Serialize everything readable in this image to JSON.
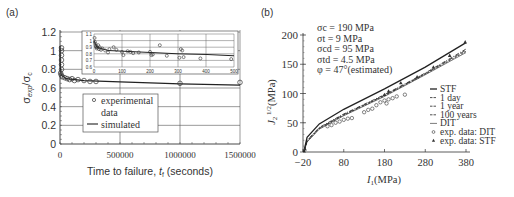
{
  "chart_data": [
    {
      "panel": "(a)",
      "type": "scatter",
      "title": "",
      "xlabel": "Time to failure, t_f (seconds)",
      "ylabel": "σ_exp/σ_c",
      "xlim": [
        0,
        1500000
      ],
      "ylim": [
        0,
        1.2
      ],
      "xticks": [
        "0",
        "500000",
        "1000000",
        "1500000"
      ],
      "yticks": [
        "0",
        "0.2",
        "0.4",
        "0.6",
        "0.8",
        "1",
        "1.2"
      ],
      "grid": true,
      "legend": {
        "position": "lower-center",
        "entries": [
          "experimental data",
          "simulated"
        ]
      },
      "series": [
        {
          "name": "experimental data",
          "marker": "circle-open",
          "points": [
            [
              0,
              1.03
            ],
            [
              0,
              1.0
            ],
            [
              0,
              0.95
            ],
            [
              0,
              0.9
            ],
            [
              0,
              0.85
            ],
            [
              0,
              0.8
            ],
            [
              5000,
              0.76
            ],
            [
              10000,
              0.74
            ],
            [
              20000,
              0.72
            ],
            [
              40000,
              0.71
            ],
            [
              60000,
              0.7
            ],
            [
              80000,
              0.69
            ],
            [
              100000,
              0.7
            ],
            [
              120000,
              0.68
            ],
            [
              150000,
              0.69
            ],
            [
              200000,
              0.68
            ],
            [
              250000,
              0.67
            ],
            [
              300000,
              0.67
            ],
            [
              1000000,
              0.65
            ],
            [
              1500000,
              0.66
            ]
          ]
        },
        {
          "name": "simulated",
          "style": "line",
          "points": [
            [
              0,
              1.05
            ],
            [
              2000,
              0.85
            ],
            [
              10000,
              0.74
            ],
            [
              50000,
              0.7
            ],
            [
              200000,
              0.68
            ],
            [
              500000,
              0.665
            ],
            [
              1000000,
              0.645
            ],
            [
              1500000,
              0.63
            ]
          ]
        }
      ],
      "inset": {
        "xlim": [
          0,
          500
        ],
        "ylim": [
          0.6,
          1.1
        ],
        "xticks": [
          "0",
          "100",
          "200",
          "300",
          "400",
          "500"
        ],
        "yticks": [
          "0.6",
          "0.7",
          "0.8",
          "0.9",
          "1",
          "1.1"
        ],
        "experimental": [
          [
            2,
            1.04
          ],
          [
            3,
            0.98
          ],
          [
            5,
            0.95
          ],
          [
            6,
            0.92
          ],
          [
            8,
            0.9
          ],
          [
            10,
            0.88
          ],
          [
            12,
            0.9
          ],
          [
            15,
            0.93
          ],
          [
            18,
            0.87
          ],
          [
            20,
            0.9
          ],
          [
            25,
            0.86
          ],
          [
            30,
            0.88
          ],
          [
            40,
            0.85
          ],
          [
            50,
            0.82
          ],
          [
            55,
            0.87
          ],
          [
            70,
            0.9
          ],
          [
            80,
            0.86
          ],
          [
            100,
            0.83
          ],
          [
            105,
            0.78
          ],
          [
            120,
            0.84
          ],
          [
            130,
            0.83
          ],
          [
            140,
            0.81
          ],
          [
            160,
            0.82
          ],
          [
            200,
            0.83
          ],
          [
            205,
            0.78
          ],
          [
            210,
            0.79
          ],
          [
            235,
            0.93
          ],
          [
            260,
            0.77
          ],
          [
            305,
            0.74
          ],
          [
            310,
            0.87
          ],
          [
            315,
            0.85
          ],
          [
            320,
            0.75
          ],
          [
            380,
            0.73
          ],
          [
            490,
            0.72
          ]
        ],
        "simulated": [
          [
            0,
            1.0
          ],
          [
            10,
            0.9
          ],
          [
            50,
            0.85
          ],
          [
            100,
            0.84
          ],
          [
            200,
            0.82
          ],
          [
            300,
            0.8
          ],
          [
            400,
            0.79
          ],
          [
            500,
            0.77
          ]
        ]
      }
    },
    {
      "panel": "(b)",
      "type": "line",
      "title": "",
      "xlabel": "I_1(MPa)",
      "ylabel": "J_2^{1/2}(MPa)",
      "xlim": [
        -20,
        380
      ],
      "ylim": [
        0,
        200
      ],
      "xticks": [
        "-20",
        "80",
        "180",
        "280",
        "380"
      ],
      "yticks": [
        "0",
        "50",
        "100",
        "150",
        "200"
      ],
      "grid": false,
      "annotations": [
        "σc = 190 MPa",
        "σt = 9 MPa",
        "σcd = 95 MPa",
        "σtd = 4.5 MPa",
        "φ = 47°(estimated)"
      ],
      "legend": {
        "position": "lower-right",
        "entries": [
          "STF",
          "1 day",
          "1 year",
          "100 years",
          "DIT",
          "exp. data: DIT",
          "exp. data: STF"
        ]
      },
      "series": [
        {
          "name": "STF",
          "style": "solid",
          "points": [
            [
              -18,
              0
            ],
            [
              -10,
              25
            ],
            [
              20,
              48
            ],
            [
              80,
              73
            ],
            [
              180,
              108
            ],
            [
              280,
              145
            ],
            [
              380,
              187
            ]
          ]
        },
        {
          "name": "1 day",
          "style": "dash-dot",
          "points": [
            [
              -18,
              0
            ],
            [
              -10,
              20
            ],
            [
              20,
              42
            ],
            [
              80,
              65
            ],
            [
              180,
              98
            ],
            [
              280,
              135
            ],
            [
              380,
              176
            ]
          ]
        },
        {
          "name": "1 year",
          "style": "long-dash",
          "points": [
            [
              -18,
              0
            ],
            [
              -10,
              19
            ],
            [
              20,
              41
            ],
            [
              80,
              64
            ],
            [
              180,
              97
            ],
            [
              280,
              134
            ],
            [
              380,
              174
            ]
          ]
        },
        {
          "name": "100 years",
          "style": "dashed",
          "points": [
            [
              -18,
              0
            ],
            [
              -10,
              18
            ],
            [
              20,
              40
            ],
            [
              80,
              63
            ],
            [
              180,
              96
            ],
            [
              280,
              133
            ],
            [
              380,
              172
            ]
          ]
        },
        {
          "name": "DIT",
          "style": "thin-solid",
          "points": [
            [
              -18,
              0
            ],
            [
              -10,
              17
            ],
            [
              20,
              39
            ],
            [
              80,
              62
            ],
            [
              180,
              95
            ],
            [
              280,
              132
            ],
            [
              380,
              170
            ]
          ]
        },
        {
          "name": "exp. data: DIT",
          "marker": "circle-open",
          "points": [
            [
              40,
              44
            ],
            [
              50,
              46
            ],
            [
              60,
              50
            ],
            [
              70,
              52
            ],
            [
              80,
              55
            ],
            [
              90,
              57
            ],
            [
              100,
              58
            ],
            [
              130,
              68
            ],
            [
              140,
              72
            ],
            [
              150,
              74
            ],
            [
              160,
              80
            ],
            [
              170,
              85
            ],
            [
              180,
              88
            ],
            [
              185,
              83
            ],
            [
              190,
              90
            ],
            [
              200,
              92
            ],
            [
              210,
              95
            ],
            [
              230,
              98
            ]
          ]
        },
        {
          "name": "exp. data: STF",
          "marker": "triangle",
          "points": [
            [
              -15,
              5
            ],
            [
              180,
              98
            ],
            [
              190,
              104
            ],
            [
              220,
              118
            ],
            [
              260,
              128
            ],
            [
              300,
              145
            ],
            [
              340,
              165
            ],
            [
              378,
              188
            ]
          ]
        }
      ]
    }
  ],
  "labels": {
    "panel_a": "(a)",
    "panel_b": "(b)"
  }
}
